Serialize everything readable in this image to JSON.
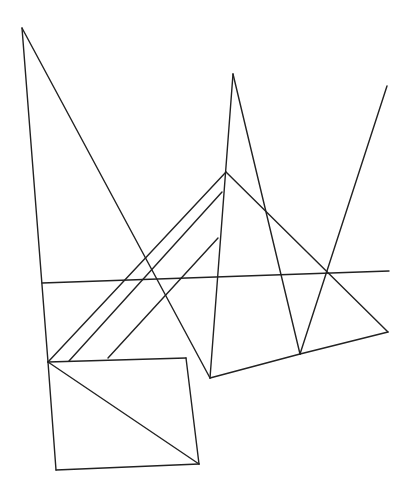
{
  "diagram": {
    "width": 409,
    "height": 499,
    "background": "#ffffff",
    "stroke_color": "#222222",
    "segments": [
      {
        "name": "left-apex-left-edge",
        "x1": 22,
        "y1": 28,
        "x2": 48,
        "y2": 362
      },
      {
        "name": "left-apex-right-edge",
        "x1": 22,
        "y1": 28,
        "x2": 210,
        "y2": 378
      },
      {
        "name": "center-spike-left-edge",
        "x1": 233,
        "y1": 74,
        "x2": 210,
        "y2": 378
      },
      {
        "name": "center-spike-right-edge",
        "x1": 233,
        "y1": 74,
        "x2": 300,
        "y2": 354
      },
      {
        "name": "right-spike-edge",
        "x1": 387,
        "y1": 86,
        "x2": 300,
        "y2": 354
      },
      {
        "name": "pyramid-left-edge",
        "x1": 226,
        "y1": 172,
        "x2": 48,
        "y2": 362
      },
      {
        "name": "pyramid-right-edge",
        "x1": 226,
        "y1": 172,
        "x2": 388,
        "y2": 332
      },
      {
        "name": "parallel-line-1",
        "x1": 222,
        "y1": 192,
        "x2": 69,
        "y2": 361
      },
      {
        "name": "parallel-line-2",
        "x1": 218,
        "y1": 238,
        "x2": 108,
        "y2": 358
      },
      {
        "name": "horizontal-line",
        "x1": 42,
        "y1": 283,
        "x2": 389,
        "y2": 271
      },
      {
        "name": "bottom-edge-left",
        "x1": 210,
        "y1": 378,
        "x2": 300,
        "y2": 354
      },
      {
        "name": "bottom-edge-right",
        "x1": 300,
        "y1": 354,
        "x2": 388,
        "y2": 332
      },
      {
        "name": "quad-top",
        "x1": 48,
        "y1": 362,
        "x2": 186,
        "y2": 358
      },
      {
        "name": "quad-right",
        "x1": 186,
        "y1": 358,
        "x2": 199,
        "y2": 464
      },
      {
        "name": "quad-bottom",
        "x1": 199,
        "y1": 464,
        "x2": 56,
        "y2": 470
      },
      {
        "name": "quad-left",
        "x1": 56,
        "y1": 470,
        "x2": 48,
        "y2": 362
      },
      {
        "name": "quad-diagonal",
        "x1": 48,
        "y1": 362,
        "x2": 199,
        "y2": 464
      }
    ]
  }
}
